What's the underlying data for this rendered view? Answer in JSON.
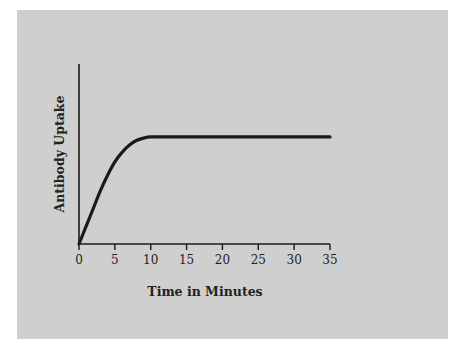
{
  "chart_data": {
    "type": "line",
    "title": "",
    "xlabel": "Time in Minutes",
    "ylabel": "Antibody Uptake",
    "x_ticks": [
      "0",
      "5",
      "10",
      "15",
      "20",
      "25",
      "30",
      "35"
    ],
    "xlim": [
      0,
      35
    ],
    "ylim": [
      0,
      1
    ],
    "grid": false,
    "legend": null,
    "series": [
      {
        "name": "Antibody Uptake",
        "x": [
          0,
          1,
          2,
          3,
          4,
          5,
          6,
          7,
          8,
          9,
          10,
          12,
          15,
          20,
          25,
          30,
          35
        ],
        "y": [
          0.0,
          0.15,
          0.3,
          0.45,
          0.58,
          0.69,
          0.77,
          0.83,
          0.87,
          0.89,
          0.9,
          0.9,
          0.9,
          0.9,
          0.9,
          0.9,
          0.9
        ]
      }
    ]
  },
  "axes": {
    "x_title": "Time in Minutes",
    "y_title": "Antibody Uptake",
    "x_tick_labels": [
      "0",
      "5",
      "10",
      "15",
      "20",
      "25",
      "30",
      "35"
    ]
  },
  "colors": {
    "panel": "#cfcfcf",
    "line": "#1a1a1a"
  }
}
